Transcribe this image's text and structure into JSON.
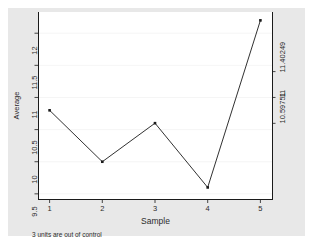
{
  "chart_data": {
    "type": "line",
    "title": "",
    "subtitle": "",
    "xlabel": "Sample",
    "ylabel": "Average",
    "x": [
      1,
      2,
      3,
      4,
      5
    ],
    "values": [
      10.8,
      10.0,
      10.6,
      9.6,
      12.2
    ],
    "series": [
      {
        "name": "Average",
        "values": [
          10.8,
          10.0,
          10.6,
          9.6,
          12.2
        ]
      }
    ],
    "categories": [
      "1",
      "2",
      "3",
      "4",
      "5"
    ],
    "xtick_labels": [
      "1",
      "2",
      "3",
      "4",
      "5"
    ],
    "ytick_labels": [
      "9.5",
      "10",
      "10.5",
      "11",
      "11.5",
      "12"
    ],
    "ytick_values": [
      9.5,
      10,
      10.5,
      11,
      11.5,
      12
    ],
    "xlim": [
      0.78,
      5.22
    ],
    "ylim": [
      9.42,
      12.33
    ],
    "grid": true,
    "grid_orientation": "horizontal",
    "legend": "none",
    "marker": "filled-square",
    "line_color": "#1a1a1a",
    "marker_color": "#1a1a1a",
    "grid_color": "#f2f2f2",
    "plot_background": "#ffffff",
    "graph_background": "#e8e8e8",
    "right_axis": {
      "label": "Control limits",
      "tick_labels": [
        "10.59751",
        "11",
        "11.40249"
      ],
      "tick_values": [
        10.59751,
        11,
        11.40249
      ]
    },
    "annotations": [
      {
        "name": "out-of-control-note",
        "text": "3 units are out of control"
      }
    ]
  },
  "axes": {
    "y_title": "Average",
    "x_title": "Sample",
    "y_ticks": [
      {
        "label": "9.5",
        "value": 9.5
      },
      {
        "label": "10",
        "value": 10
      },
      {
        "label": "10.5",
        "value": 10.5
      },
      {
        "label": "11",
        "value": 11
      },
      {
        "label": "11.5",
        "value": 11.5
      },
      {
        "label": "12",
        "value": 12
      }
    ],
    "x_ticks": [
      {
        "label": "1",
        "value": 1
      },
      {
        "label": "2",
        "value": 2
      },
      {
        "label": "3",
        "value": 3
      },
      {
        "label": "4",
        "value": 4
      },
      {
        "label": "5",
        "value": 5
      }
    ],
    "right_ticks": [
      {
        "label": "10.59751",
        "value": 10.59751
      },
      {
        "label": "11",
        "value": 11
      },
      {
        "label": "11.40249",
        "value": 11.40249
      }
    ]
  },
  "note": {
    "text": "3 units are out of control"
  }
}
